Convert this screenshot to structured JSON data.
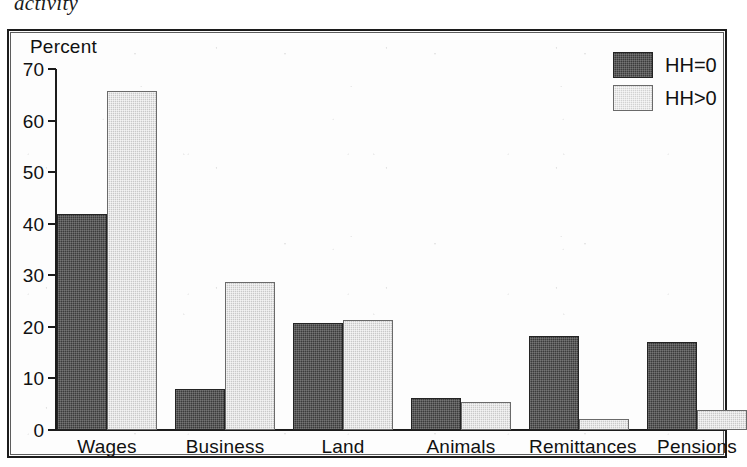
{
  "caption": {
    "text": "activity"
  },
  "axis": {
    "y_title": "Percent",
    "ticks": [
      "70",
      "60",
      "50",
      "40",
      "30",
      "20",
      "10",
      "0"
    ]
  },
  "legend": {
    "entries": [
      {
        "label": "HH=0",
        "swatch": "dark-swatch",
        "color": "#3b3b3b"
      },
      {
        "label": "HH>0",
        "swatch": "light-swatch",
        "color": "#d2d2d2"
      }
    ]
  },
  "chart_data": {
    "type": "bar",
    "title": "activity",
    "xlabel": "",
    "ylabel": "Percent",
    "ylim": [
      0,
      70
    ],
    "yticks": [
      0,
      10,
      20,
      30,
      40,
      50,
      60,
      70
    ],
    "grid": false,
    "legend_position": "top-right",
    "categories": [
      "Wages",
      "Business",
      "Land",
      "Animals",
      "Remittances",
      "Pensions"
    ],
    "series": [
      {
        "name": "HH=0",
        "values": [
          41.8,
          7.9,
          20.7,
          6.3,
          18.3,
          17.0
        ]
      },
      {
        "name": "HH>0",
        "values": [
          65.8,
          28.7,
          21.4,
          5.4,
          2.1,
          3.9
        ]
      }
    ]
  }
}
